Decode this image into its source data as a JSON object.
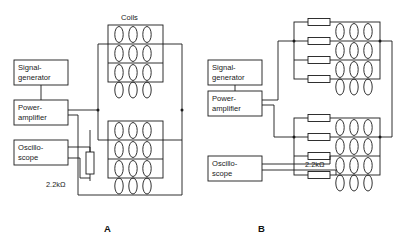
{
  "figure": {
    "title": "",
    "type": "circuit-diagram",
    "panels": [
      {
        "id": "A",
        "letter": "A",
        "instruments": [
          {
            "name": "signal-generator",
            "line1": "Signal-",
            "line2": "generator"
          },
          {
            "name": "power-amplifier",
            "line1": "Power-",
            "line2": "amplifier"
          },
          {
            "name": "oscilloscope",
            "line1": "Oscillo-",
            "line2": "scope"
          }
        ],
        "components": [
          {
            "name": "series-resistor",
            "label": "2.2kΩ"
          }
        ],
        "coil_array_label": "Coils",
        "coil_arrays": [
          {
            "name": "upper-coil-array",
            "rows": 4,
            "coils_per_row": 3
          },
          {
            "name": "lower-coil-array",
            "rows": 4,
            "coils_per_row": 3
          }
        ]
      },
      {
        "id": "B",
        "letter": "B",
        "instruments": [
          {
            "name": "signal-generator",
            "line1": "Signal-",
            "line2": "generator"
          },
          {
            "name": "power-amplifier",
            "line1": "Power-",
            "line2": "amplifier"
          },
          {
            "name": "oscilloscope",
            "line1": "Oscillo-",
            "line2": "scope"
          }
        ],
        "components": [
          {
            "name": "series-resistor",
            "label": "2.2kΩ"
          }
        ],
        "coil_array_label": "",
        "coil_arrays": [
          {
            "name": "upper-coil-array",
            "rows": 4,
            "coils_per_row": 3,
            "resistors_per_array": 4
          },
          {
            "name": "lower-coil-array",
            "rows": 4,
            "coils_per_row": 3,
            "resistors_per_array": 4
          }
        ]
      }
    ],
    "colors": {
      "ink": "#1a1a1a",
      "background": "#ffffff"
    }
  },
  "labels": {
    "coils": "Coils",
    "resistor_a": "2.2kΩ",
    "resistor_b": "2.2kΩ",
    "panel_a": "A",
    "panel_b": "B",
    "signal_generator_l1": "Signal-",
    "signal_generator_l2": "generator",
    "power_amplifier_l1": "Power-",
    "power_amplifier_l2": "amplifier",
    "oscilloscope_l1": "Oscillo-",
    "oscilloscope_l2": "scope"
  }
}
